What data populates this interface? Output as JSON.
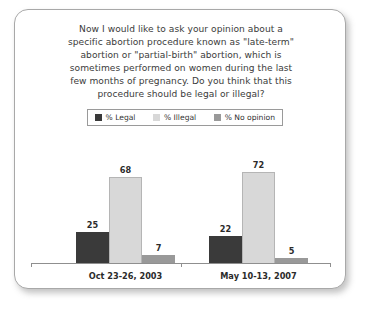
{
  "question": {
    "lines": [
      "Now I would like to ask your opinion about a",
      "specific abortion procedure known as \"late-term\"",
      "abortion or \"partial-birth\" abortion, which is",
      "sometimes performed on women during the last",
      "few months of pregnancy. Do you think that this",
      "procedure should be legal or illegal?"
    ]
  },
  "colors": {
    "legal": "#3a3a3a",
    "illegal": "#d8d8d8",
    "no_opinion": "#999999",
    "border": "#a8a8a8",
    "axis": "#8f8f8f",
    "text": "#3b3b3b"
  },
  "chart_data": {
    "type": "bar",
    "title": "",
    "xlabel": "",
    "ylabel": "",
    "ylim": [
      0,
      100
    ],
    "grid": false,
    "legend_position": "top-center",
    "categories": [
      "Oct 23-26, 2003",
      "May 10-13, 2007"
    ],
    "series": [
      {
        "name": "% Legal",
        "color": "#3a3a3a",
        "values": [
          25,
          22
        ]
      },
      {
        "name": "% Illegal",
        "color": "#d8d8d8",
        "values": [
          68,
          72
        ]
      },
      {
        "name": "% No opinion",
        "color": "#999999",
        "values": [
          7,
          5
        ]
      }
    ]
  }
}
